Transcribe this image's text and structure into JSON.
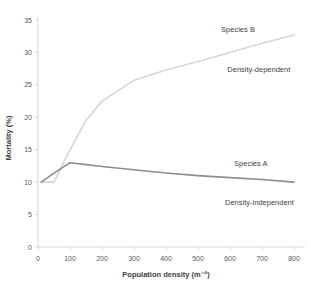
{
  "chart_data": {
    "type": "line",
    "title": "",
    "xlabel": "Population density (m⁻²)",
    "ylabel": "Mortality (%)",
    "xlim": [
      0,
      800
    ],
    "ylim": [
      0,
      35
    ],
    "x_ticks": [
      0,
      100,
      200,
      300,
      400,
      500,
      600,
      700,
      800
    ],
    "y_ticks": [
      0,
      5,
      10,
      15,
      20,
      25,
      30,
      35
    ],
    "grid": false,
    "legend": "inline-annotations",
    "series": [
      {
        "name": "Species B",
        "relationship": "Density-dependent",
        "color": "#d6d6d6",
        "x": [
          10,
          50,
          100,
          150,
          200,
          300,
          400,
          500,
          600,
          700,
          800
        ],
        "y": [
          10,
          10,
          15,
          19.5,
          22.5,
          25.7,
          27.3,
          28.6,
          30,
          31.4,
          32.7
        ]
      },
      {
        "name": "Species A",
        "relationship": "Density-independent",
        "color": "#8c8c8c",
        "x": [
          10,
          50,
          100,
          150,
          200,
          300,
          400,
          500,
          600,
          700,
          800
        ],
        "y": [
          10,
          11.4,
          13,
          12.7,
          12.4,
          11.9,
          11.4,
          11,
          10.7,
          10.4,
          10
        ]
      }
    ],
    "annotations": [
      {
        "label": "Species B",
        "x": 625,
        "y": 33.5
      },
      {
        "label": "Density-dependent",
        "x": 690,
        "y": 27.3
      },
      {
        "label": "Species A",
        "x": 665,
        "y": 12.9
      },
      {
        "label": "Density-independent",
        "x": 692,
        "y": 6.9
      }
    ]
  },
  "colors": {
    "axis_line": "#d9d9d9",
    "tick_label": "#595959",
    "axis_title": "#404040",
    "annotation_text": "#3f3f3f",
    "series_b_line": "#d6d6d6",
    "series_a_line": "#8c8c8c",
    "background": "#ffffff"
  }
}
